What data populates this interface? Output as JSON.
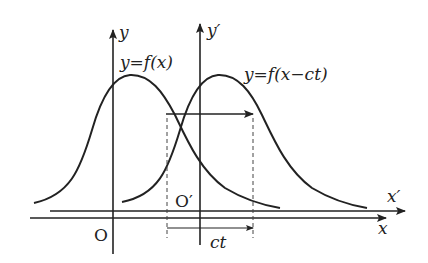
{
  "diagram": {
    "axes": {
      "y_label": "y",
      "y_prime_label": "y′",
      "x_label": "x",
      "x_prime_label": "x′",
      "origin_label": "O",
      "origin_prime_label": "O′"
    },
    "curves": [
      {
        "label": "y=f(x)"
      },
      {
        "label": "y=f(x−ct)"
      }
    ],
    "displacement_label": "ct",
    "colors": {
      "stroke": "#222222",
      "background": "#ffffff"
    }
  }
}
